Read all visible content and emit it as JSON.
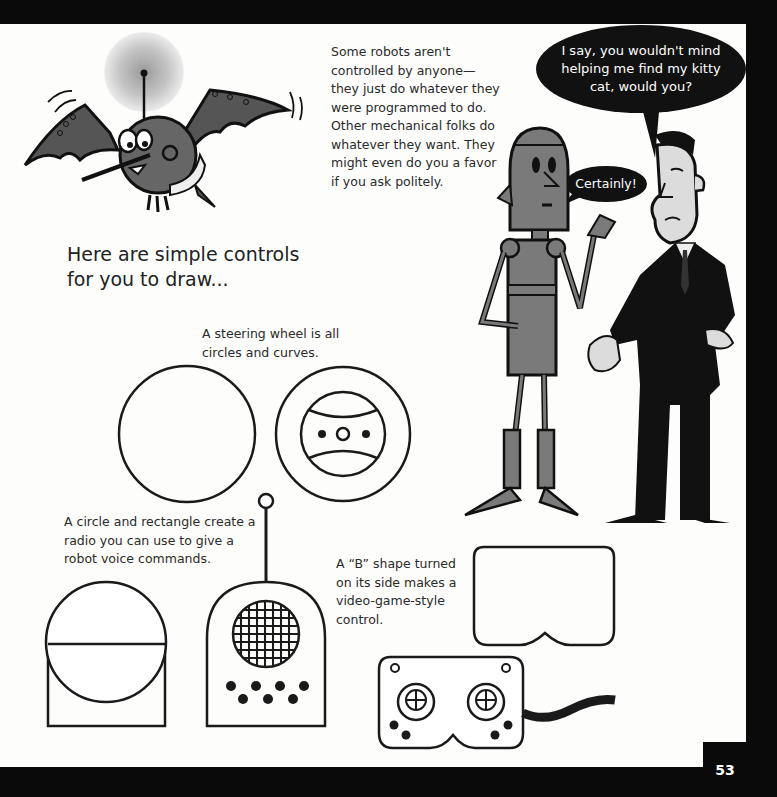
{
  "page": {
    "page_number": "53",
    "intro_text": "Some robots aren't controlled by anyone—they just do whatever they were programmed to do. Other mechanical folks do whatever they want. They might even do you a favor if you ask politely.",
    "heading_line1": "Here are simple controls",
    "heading_line2": "for you to draw...",
    "captions": {
      "steering_wheel": "A steering wheel is all circles and curves.",
      "radio": "A circle and rectangle create a radio you can use to give a robot voice commands.",
      "game_controller": "A “B” shape turned on its side makes a video-game-style control."
    },
    "speech": {
      "man": "I say, you wouldn't mind helping me find my kitty cat, would you?",
      "robot": "Certainly!"
    }
  },
  "illustrations": [
    {
      "name": "flying-bat-robot"
    },
    {
      "name": "tall-robot"
    },
    {
      "name": "man-in-suit"
    },
    {
      "name": "steering-wheel-step1-circle"
    },
    {
      "name": "steering-wheel-step2-final"
    },
    {
      "name": "radio-step1-circle-rectangle"
    },
    {
      "name": "radio-step2-final"
    },
    {
      "name": "controller-step1-b-shape"
    },
    {
      "name": "controller-step2-final"
    }
  ],
  "colors": {
    "background_frame": "#0a0a0a",
    "page": "#fdfdfb",
    "ink": "#1a1a1a",
    "robot_gray": "#7a7a7a",
    "skin": "#dcdcdc"
  }
}
